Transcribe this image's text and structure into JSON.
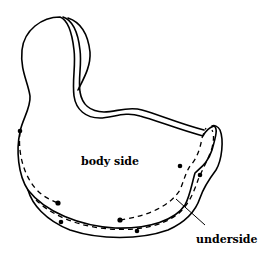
{
  "diagram": {
    "labels": {
      "body_side": "body side",
      "underside": "underside"
    },
    "colors": {
      "line": "#000000",
      "background": "#ffffff"
    }
  }
}
